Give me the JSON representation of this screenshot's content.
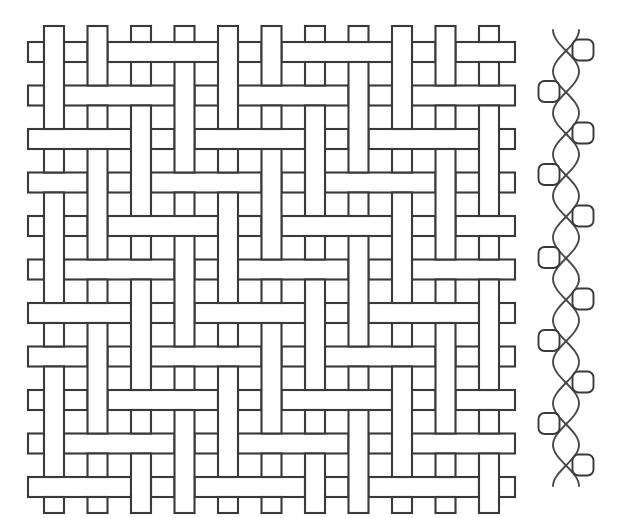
{
  "figure": {
    "background_color": "#ffffff",
    "stroke_color": "#3a3a3a",
    "fill_color": "#ffffff",
    "width": 617,
    "height": 518
  },
  "weave_diagram": {
    "name": "plain-weave-top-view",
    "description": "Top view of interlaced warp and weft yarns",
    "origin_x": 28,
    "origin_y": 26,
    "pitch": 43.5,
    "yarn_width": 20,
    "stroke_width": 2.1,
    "warp_count": 11,
    "weft_count": 11,
    "overhang": 16,
    "interlacing_rule": "float-offset",
    "float_period": 2,
    "warp_ends_visible": 11,
    "weft_picks_visible": 11
  },
  "cross_section": {
    "name": "yarn-cross-section",
    "description": "Side view showing two warp yarns interlacing around weft yarn cross-sections",
    "center_x": 566,
    "top_y": 30,
    "bottom_y": 486,
    "wave_amplitude": 13,
    "wave_period": 83,
    "stroke_width": 1.9,
    "warp_curve_count": 2,
    "weft_node_count": 11,
    "weft_node_size": 21,
    "weft_node_radius": 6,
    "left_column_nodes": 5,
    "right_column_nodes": 6,
    "left_column_x": 549,
    "right_column_x": 583,
    "node_spacing": 41.5,
    "first_node_y": 50
  },
  "colors": {
    "stroke": "#3a3a3a",
    "stroke_soft": "#4a4a4a",
    "fill": "#ffffff",
    "background": "#ffffff"
  }
}
